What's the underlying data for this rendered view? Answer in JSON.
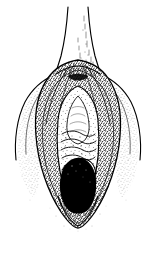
{
  "plate": {
    "title": "Anatomical line drawing plate",
    "subject": "external genital anatomy, frontal view",
    "caption": "",
    "figure_label": "",
    "medium": "pen-and-ink stipple and hatch engraving",
    "background_color": "#ffffff",
    "ink_color": "#000000",
    "frame_color": "#4a4a4a",
    "frame_inset_px": 7,
    "canvas": {
      "width": 156,
      "height": 258
    }
  },
  "artwork": {
    "structures": [
      {
        "name": "superior-tubular-shaft",
        "label": "tapering tubular form descending from top edge",
        "region": "top-center",
        "shading": "fine vertical line hatching on right side",
        "bbox": [
          62,
          7,
          32,
          60
        ]
      },
      {
        "name": "bifurcation-junction",
        "label": "junction where shaft meets flared body",
        "region": "upper-center",
        "shading": "dense short hatch strokes",
        "bbox": [
          52,
          58,
          52,
          24
        ]
      },
      {
        "name": "left-lateral-fold",
        "label": "left outer fold sweeping down and outward",
        "region": "left",
        "shading": "graded stipple fading to white margin",
        "bbox": [
          18,
          72,
          48,
          130
        ]
      },
      {
        "name": "right-lateral-fold",
        "label": "right outer fold sweeping down and outward",
        "region": "right",
        "shading": "graded stipple fading to white margin",
        "bbox": [
          90,
          72,
          48,
          130
        ]
      },
      {
        "name": "central-vestibule-oval",
        "label": "lighter central oval cavity with contour detail",
        "region": "center",
        "shading": "light stipple with wavy transverse fold lines",
        "bbox": [
          58,
          92,
          42,
          80
        ]
      },
      {
        "name": "transverse-rugae-folds",
        "label": "wavy horizontal contour folds in mid cavity",
        "region": "center",
        "count": 5,
        "bbox": [
          60,
          126,
          38,
          28
        ]
      },
      {
        "name": "inferior-dark-aperture",
        "label": "solid black ovoid opening in lower center",
        "region": "lower-center",
        "shading": "solid fill",
        "bbox": [
          58,
          158,
          40,
          54
        ]
      },
      {
        "name": "inferior-taper",
        "label": "rounded lower terminus with fading stipple",
        "region": "bottom-center",
        "shading": "stipple fading outward",
        "bbox": [
          46,
          196,
          64,
          34
        ]
      }
    ],
    "stipple": {
      "density_center": "dense",
      "density_margin": "sparse",
      "dot_color": "#000000"
    }
  }
}
